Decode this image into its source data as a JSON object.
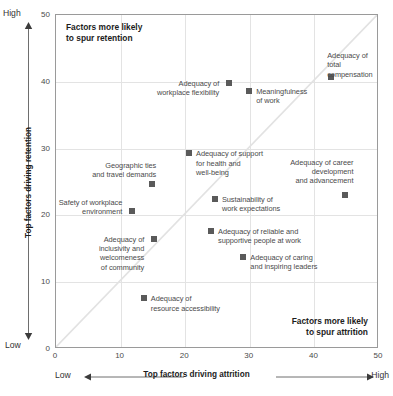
{
  "chart_data": {
    "type": "scatter",
    "title": "",
    "xlabel": "Top factors driving attrition",
    "ylabel": "Top factors driving retention",
    "xlim": [
      0,
      50
    ],
    "ylim": [
      0,
      50
    ],
    "xticks": [
      "0",
      "10",
      "20",
      "30",
      "40",
      "50"
    ],
    "yticks": [
      "0",
      "10",
      "20",
      "30",
      "40",
      "50"
    ],
    "xtick_values": [
      0,
      10,
      20,
      30,
      40,
      50
    ],
    "ytick_values": [
      0,
      10,
      20,
      30,
      40,
      50
    ],
    "grid": true,
    "legend": "none",
    "axis_low_label": "Low",
    "axis_high_label": "High",
    "reference_line": {
      "type": "diagonal",
      "from": [
        0,
        0
      ],
      "to": [
        50,
        50
      ]
    },
    "annotations": [
      {
        "name": "retention-quadrant-note",
        "text": "Factors more likely\nto spur retention",
        "position": "top-left"
      },
      {
        "name": "attrition-quadrant-note",
        "text": "Factors more likely\nto spur attrition",
        "position": "bottom-right"
      }
    ],
    "points": [
      {
        "label": "Adequacy of total\ncompensation",
        "x": 42.6,
        "y": 40.7,
        "label_dx": -4,
        "label_dy": -26,
        "align": "left"
      },
      {
        "label": "Adequacy of\nworkplace flexibility",
        "x": 26.8,
        "y": 39.8,
        "label_dx": -8,
        "label_dy": -4,
        "align": "right"
      },
      {
        "label": "Meaningfulness\nof work",
        "x": 29.9,
        "y": 38.6,
        "label_dx": 7,
        "label_dy": -4,
        "align": "left"
      },
      {
        "label": "Adequacy of support\nfor health and\nwell-being",
        "x": 20.6,
        "y": 29.3,
        "label_dx": 7,
        "label_dy": -4,
        "align": "left"
      },
      {
        "label": "Geographic ties\nand travel demands",
        "x": 14.9,
        "y": 24.7,
        "label_dx": 6,
        "label_dy": -23,
        "align": "right"
      },
      {
        "label": "Adequacy of career\ndevelopment\nand advancement",
        "x": 44.8,
        "y": 23.1,
        "label_dx": 10,
        "label_dy": -37,
        "align": "right"
      },
      {
        "label": "Sustainability of\nwork expectations",
        "x": 24.6,
        "y": 22.5,
        "label_dx": 7,
        "label_dy": -4,
        "align": "left"
      },
      {
        "label": "Safety of workplace\nenvironment",
        "x": 11.8,
        "y": 20.7,
        "label_dx": -8,
        "label_dy": -13,
        "align": "right"
      },
      {
        "label": "Adequacy of reliable and\nsupportive people at work",
        "x": 24.0,
        "y": 17.7,
        "label_dx": 7,
        "label_dy": -4,
        "align": "left"
      },
      {
        "label": "Adequacy of\ninclusivity and welcomeness\nof community",
        "x": 15.2,
        "y": 16.5,
        "label_dx": -8,
        "label_dy": -4,
        "align": "right"
      },
      {
        "label": "Adequacy of caring\nand inspiring leaders",
        "x": 29.0,
        "y": 13.8,
        "label_dx": 7,
        "label_dy": -4,
        "align": "left"
      },
      {
        "label": "Adequacy of\nresource accessibility",
        "x": 13.6,
        "y": 7.6,
        "label_dx": 7,
        "label_dy": -4,
        "align": "left"
      }
    ],
    "colors": {
      "marker": "#5a5a5a",
      "grid": "#e3e3e3",
      "axis": "#9a9a9a",
      "diagonal": "#e0e0e0",
      "text": "#4a4a4a",
      "bold_text": "#1c1c1c"
    }
  }
}
